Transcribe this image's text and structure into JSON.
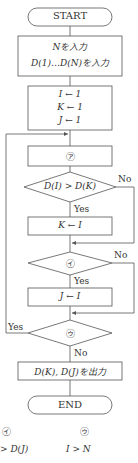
{
  "flowchart": {
    "start": "START",
    "input_line1": "Nを入力",
    "input_line2": "D(1)…D(N)を入力",
    "init_line1": "I ← 1",
    "init_line2": "K ← 1",
    "init_line3": "J ← 1",
    "process_a": "㋐",
    "decision1": "D(I) > D(K)",
    "decision1_no": "No",
    "decision1_yes": "Yes",
    "assign_k": "K ← I",
    "decision2": "㋑",
    "decision2_no": "No",
    "decision2_yes": "Yes",
    "assign_j": "J ← I",
    "decision3": "㋒",
    "decision3_yes": "Yes",
    "decision3_no": "No",
    "output": "D(K), D(J)を出力",
    "end": "END"
  },
  "options": {
    "header_i": "㋑",
    "header_u": "㋒",
    "row1_i": "> D(J)",
    "row1_u": "I > N"
  }
}
